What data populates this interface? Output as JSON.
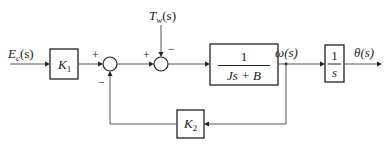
{
  "diagram": {
    "type": "block-diagram",
    "signals": {
      "input": "E",
      "input_sub": "c",
      "input_arg": "(s)",
      "disturbance": "T",
      "disturbance_sub": "w",
      "disturbance_arg": "(s)",
      "omega": "ω(s)",
      "output": "θ(s)"
    },
    "blocks": {
      "k1": {
        "name": "K",
        "sub": "1"
      },
      "plant": {
        "numerator": "1",
        "denominator": "Js + B"
      },
      "integrator": {
        "numerator": "1",
        "denominator": "s"
      },
      "k2": {
        "name": "K",
        "sub": "2"
      }
    },
    "summers": {
      "sum1": {
        "plus": "+",
        "minus": "−"
      },
      "sum2": {
        "plus": "+",
        "minus": "−"
      }
    }
  }
}
